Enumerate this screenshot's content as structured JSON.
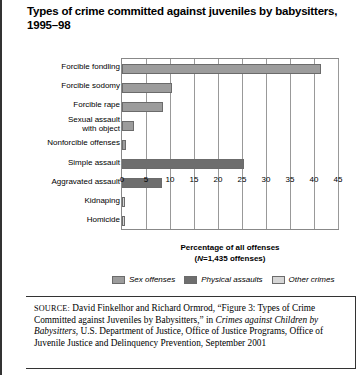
{
  "figure": {
    "title": "Types of crime committed against juveniles by babysitters, 1995–98"
  },
  "chart_data": {
    "type": "bar",
    "orientation": "horizontal",
    "title": "Types of crime committed against juveniles by babysitters, 1995–98",
    "xlabel": "Percentage of all offenses",
    "xlabel_sub": "(N=1,435 offenses)",
    "ylabel": "",
    "xlim": [
      0,
      45
    ],
    "xticks": [
      0,
      5,
      10,
      15,
      20,
      25,
      30,
      35,
      40,
      45
    ],
    "ticklabels": [
      "0",
      "5",
      "10",
      "15",
      "20",
      "25",
      "30",
      "35",
      "40",
      "45"
    ],
    "grid": true,
    "legend_position": "bottom",
    "categories": [
      "Forcible fondling",
      "Forcible sodomy",
      "Forcible rape",
      "Sexual assault with object",
      "Nonforcible offenses",
      "Simple assault",
      "Aggravated assault",
      "Kidnaping",
      "Homicide"
    ],
    "values": [
      41.5,
      10.4,
      8.5,
      2.6,
      0.8,
      25.4,
      8.4,
      0.3,
      0.3
    ],
    "groups": [
      "Sex offenses",
      "Sex offenses",
      "Sex offenses",
      "Sex offenses",
      "Sex offenses",
      "Physical assaults",
      "Physical assaults",
      "Other crimes",
      "Other crimes"
    ],
    "series": [
      {
        "name": "Sex offenses",
        "color": "#9c9c9c",
        "points": [
          {
            "category": "Forcible fondling",
            "value": 41.5
          },
          {
            "category": "Forcible sodomy",
            "value": 10.4
          },
          {
            "category": "Forcible rape",
            "value": 8.5
          },
          {
            "category": "Sexual assault with object",
            "value": 2.6
          },
          {
            "category": "Nonforcible offenses",
            "value": 0.8
          }
        ]
      },
      {
        "name": "Physical assaults",
        "color": "#6e6e6e",
        "points": [
          {
            "category": "Simple assault",
            "value": 25.4
          },
          {
            "category": "Aggravated assault",
            "value": 8.4
          }
        ]
      },
      {
        "name": "Other crimes",
        "color": "#d6d6d6",
        "points": [
          {
            "category": "Kidnaping",
            "value": 0.3
          },
          {
            "category": "Homicide",
            "value": 0.3
          }
        ]
      }
    ],
    "legend": [
      {
        "label": "Sex offenses",
        "color": "#9c9c9c"
      },
      {
        "label": "Physical assaults",
        "color": "#6e6e6e"
      },
      {
        "label": "Other crimes",
        "color": "#d6d6d6"
      }
    ]
  },
  "source": {
    "label": "SOURCE:",
    "text_1": " David Finkelhor and Richard Ormrod, “Figure 3: Types of Crime Committed against Juveniles by Babysitters,” in ",
    "italic_1": "Crimes against Children by Babysitters",
    "text_2": ", U.S. Department of Justice, Office of Justice Programs, Office of Juvenile Justice and Delinquency Prevention, September 2001"
  }
}
